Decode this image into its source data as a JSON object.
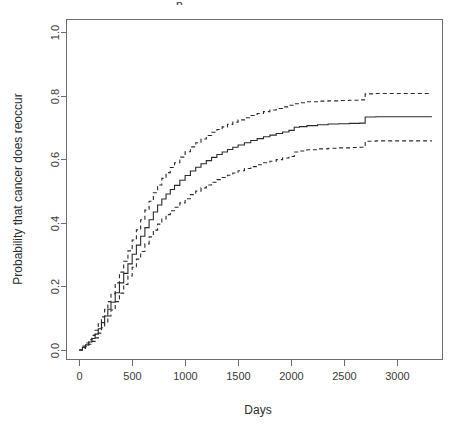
{
  "chart_data": {
    "type": "line",
    "title": "",
    "title_fragment": "p",
    "xlabel": "Days",
    "ylabel": "Probability that cancer does reoccur",
    "xlim": [
      -120,
      3430
    ],
    "ylim": [
      -0.03,
      1.04
    ],
    "xticks": [
      0,
      500,
      1000,
      1500,
      2000,
      2500,
      3000
    ],
    "xticklabels": [
      "0",
      "500",
      "1000",
      "1500",
      "2000",
      "2500",
      "3000"
    ],
    "yticks": [
      0.0,
      0.2,
      0.4,
      0.6,
      0.8,
      1.0
    ],
    "yticklabels": [
      "0.0",
      "0.2",
      "0.4",
      "0.6",
      "0.8",
      "1.0"
    ],
    "grid": false,
    "legend": null,
    "frame": true,
    "series": [
      {
        "name": "Upper 95% confidence limit",
        "style": "dashed",
        "color": "#2a2a2a",
        "x": [
          0,
          30,
          60,
          90,
          120,
          150,
          180,
          210,
          240,
          270,
          300,
          340,
          380,
          420,
          460,
          500,
          540,
          580,
          620,
          660,
          700,
          740,
          780,
          820,
          860,
          900,
          950,
          1000,
          1050,
          1100,
          1150,
          1200,
          1250,
          1300,
          1350,
          1400,
          1450,
          1500,
          1560,
          1620,
          1680,
          1740,
          1800,
          1860,
          1920,
          1980,
          2030,
          2080,
          2150,
          2250,
          2350,
          2450,
          2550,
          2650,
          2700,
          2800,
          2950,
          3100,
          3250,
          3330
        ],
        "y": [
          0.0,
          0.012,
          0.022,
          0.032,
          0.046,
          0.062,
          0.082,
          0.104,
          0.128,
          0.152,
          0.177,
          0.211,
          0.245,
          0.279,
          0.312,
          0.346,
          0.378,
          0.41,
          0.44,
          0.468,
          0.495,
          0.519,
          0.54,
          0.558,
          0.574,
          0.589,
          0.607,
          0.624,
          0.639,
          0.652,
          0.664,
          0.675,
          0.685,
          0.694,
          0.702,
          0.71,
          0.717,
          0.724,
          0.731,
          0.738,
          0.744,
          0.75,
          0.755,
          0.76,
          0.765,
          0.77,
          0.775,
          0.778,
          0.781,
          0.783,
          0.784,
          0.785,
          0.786,
          0.787,
          0.806,
          0.807,
          0.807,
          0.807,
          0.807,
          0.807
        ]
      },
      {
        "name": "Kaplan-Meier estimate",
        "style": "solid",
        "color": "#2a2a2a",
        "x": [
          0,
          30,
          60,
          90,
          120,
          150,
          180,
          210,
          240,
          270,
          300,
          340,
          380,
          420,
          460,
          500,
          540,
          580,
          620,
          660,
          700,
          740,
          780,
          820,
          860,
          900,
          950,
          1000,
          1050,
          1100,
          1150,
          1200,
          1250,
          1300,
          1350,
          1400,
          1450,
          1500,
          1560,
          1620,
          1680,
          1740,
          1800,
          1860,
          1920,
          1980,
          2030,
          2080,
          2150,
          2250,
          2350,
          2450,
          2550,
          2650,
          2700,
          2800,
          2950,
          3100,
          3250,
          3330
        ],
        "y": [
          0.0,
          0.008,
          0.016,
          0.025,
          0.036,
          0.05,
          0.067,
          0.086,
          0.107,
          0.128,
          0.15,
          0.18,
          0.211,
          0.241,
          0.271,
          0.301,
          0.33,
          0.358,
          0.385,
          0.41,
          0.434,
          0.456,
          0.475,
          0.491,
          0.505,
          0.518,
          0.534,
          0.549,
          0.563,
          0.575,
          0.586,
          0.596,
          0.606,
          0.615,
          0.623,
          0.631,
          0.638,
          0.645,
          0.652,
          0.659,
          0.665,
          0.671,
          0.676,
          0.681,
          0.686,
          0.691,
          0.701,
          0.703,
          0.706,
          0.709,
          0.711,
          0.712,
          0.713,
          0.714,
          0.733,
          0.734,
          0.734,
          0.734,
          0.734,
          0.734
        ]
      },
      {
        "name": "Lower 95% confidence limit",
        "style": "dashed",
        "color": "#2a2a2a",
        "x": [
          0,
          30,
          60,
          90,
          120,
          150,
          180,
          210,
          240,
          270,
          300,
          340,
          380,
          420,
          460,
          500,
          540,
          580,
          620,
          660,
          700,
          740,
          780,
          820,
          860,
          900,
          950,
          1000,
          1050,
          1100,
          1150,
          1200,
          1250,
          1300,
          1350,
          1400,
          1450,
          1500,
          1560,
          1620,
          1680,
          1740,
          1800,
          1860,
          1920,
          1980,
          2030,
          2080,
          2150,
          2250,
          2350,
          2450,
          2550,
          2650,
          2700,
          2800,
          2950,
          3100,
          3250,
          3330
        ],
        "y": [
          0.0,
          0.005,
          0.011,
          0.018,
          0.027,
          0.038,
          0.053,
          0.07,
          0.088,
          0.107,
          0.126,
          0.152,
          0.179,
          0.206,
          0.233,
          0.26,
          0.286,
          0.31,
          0.334,
          0.356,
          0.377,
          0.396,
          0.412,
          0.426,
          0.438,
          0.449,
          0.463,
          0.476,
          0.489,
          0.5,
          0.51,
          0.519,
          0.528,
          0.536,
          0.543,
          0.55,
          0.557,
          0.564,
          0.571,
          0.577,
          0.583,
          0.589,
          0.594,
          0.599,
          0.604,
          0.609,
          0.623,
          0.626,
          0.63,
          0.633,
          0.635,
          0.636,
          0.637,
          0.638,
          0.657,
          0.658,
          0.658,
          0.658,
          0.658,
          0.658
        ]
      }
    ]
  },
  "axis": {
    "x_title": "Days",
    "y_title": "Probability that cancer does reoccur"
  },
  "colors": {
    "curve": "#2a2a2a",
    "axis": "#6d6d6d",
    "background": "#ffffff"
  }
}
